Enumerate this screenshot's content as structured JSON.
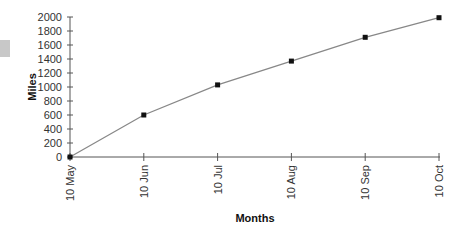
{
  "chart_data": {
    "type": "line",
    "title": "",
    "xlabel": "Months",
    "ylabel": "Miles",
    "categories": [
      "10 May",
      "10 Jun",
      "10 Jul",
      "10 Aug",
      "10 Sep",
      "10 Oct"
    ],
    "series": [
      {
        "name": "Miles",
        "values": [
          0,
          600,
          1030,
          1370,
          1710,
          1990
        ]
      }
    ],
    "ylim": [
      0,
      2000
    ],
    "yticks": [
      0,
      200,
      400,
      600,
      800,
      1000,
      1200,
      1400,
      1600,
      1800,
      2000
    ],
    "grid": false,
    "legend": "none",
    "colors": {
      "line": "#888888",
      "marker": "#111111",
      "axis": "#555555",
      "side_swatch": "#c8c8c8"
    }
  }
}
